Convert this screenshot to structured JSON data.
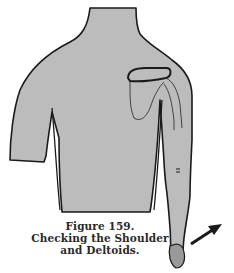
{
  "figure": {
    "number_label": "Figure 159.",
    "title_line1": "Checking the Shoulder",
    "title_line2": "and Deltoids."
  },
  "illustration": {
    "subject": "torso-with-shoulder-and-arm",
    "fill_color": "#bdbdbd",
    "outline_color": "#1a1a1a",
    "annotation": "arrow-icon pointing up-right"
  }
}
